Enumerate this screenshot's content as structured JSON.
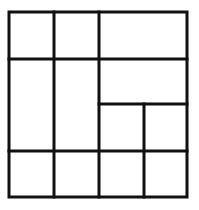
{
  "diagram": {
    "type": "rectangle-partition-grid",
    "stroke_color": "#111111",
    "stroke_width": 3,
    "background": "#ffffff",
    "outer": {
      "x1": 9,
      "y1": 12,
      "x2": 187,
      "y2": 197
    },
    "lines": [
      {
        "id": "v1",
        "x1": 54,
        "y1": 12,
        "x2": 54,
        "y2": 197
      },
      {
        "id": "v2",
        "x1": 99,
        "y1": 12,
        "x2": 99,
        "y2": 197
      },
      {
        "id": "h1",
        "x1": 9,
        "y1": 59,
        "x2": 187,
        "y2": 59
      },
      {
        "id": "h2",
        "x1": 99,
        "y1": 104,
        "x2": 187,
        "y2": 104
      },
      {
        "id": "h3",
        "x1": 9,
        "y1": 151,
        "x2": 187,
        "y2": 151
      },
      {
        "id": "v3",
        "x1": 144,
        "y1": 104,
        "x2": 144,
        "y2": 197
      }
    ],
    "cell_count": 12
  }
}
